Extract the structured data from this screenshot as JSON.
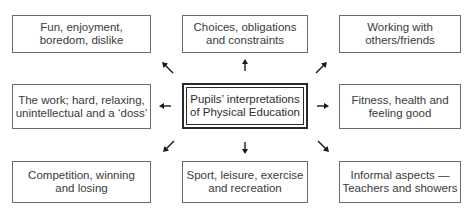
{
  "diagram": {
    "type": "concept-map",
    "center": {
      "label": "Pupils’ interpretations\nof Physical Education"
    },
    "nodes": [
      {
        "id": "top-left",
        "label": "Fun, enjoyment,\nboredom, dislike",
        "direction": "north-west"
      },
      {
        "id": "top-center",
        "label": "Choices, obligations\nand constraints",
        "direction": "north"
      },
      {
        "id": "top-right",
        "label": "Working with\nothers/friends",
        "direction": "north-east"
      },
      {
        "id": "middle-left",
        "label": "The work; hard, relaxing,\nunintellectual and a ‘doss’",
        "direction": "west"
      },
      {
        "id": "middle-right",
        "label": "Fitness, health and\nfeeling good",
        "direction": "east"
      },
      {
        "id": "bottom-left",
        "label": "Competition, winning\nand losing",
        "direction": "south-west"
      },
      {
        "id": "bottom-center",
        "label": "Sport, leisure, exercise\nand recreation",
        "direction": "south"
      },
      {
        "id": "bottom-right",
        "label": "Informal aspects —\nTeachers and showers",
        "direction": "south-east"
      }
    ],
    "edges": [
      {
        "from": "center",
        "to": "top-left"
      },
      {
        "from": "center",
        "to": "top-center"
      },
      {
        "from": "center",
        "to": "top-right"
      },
      {
        "from": "center",
        "to": "middle-left"
      },
      {
        "from": "center",
        "to": "middle-right"
      },
      {
        "from": "center",
        "to": "bottom-left"
      },
      {
        "from": "center",
        "to": "bottom-center"
      },
      {
        "from": "center",
        "to": "bottom-right"
      }
    ],
    "colors": {
      "border": "#6a6a6a",
      "center_border": "#2a2a2a",
      "text": "#3a3a3a",
      "arrow": "#1a1a1a"
    }
  }
}
